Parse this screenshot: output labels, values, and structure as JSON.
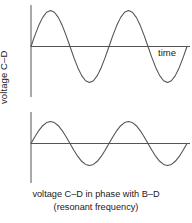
{
  "figure": {
    "caption_line1": "voltage C–D in phase with B–D",
    "caption_line2": "(resonant frequency)",
    "stroke_color": "#555555",
    "text_color": "#1a1a1a",
    "background_color": "#ffffff"
  },
  "chart_data": [
    {
      "type": "line",
      "title": "",
      "name": "voltage-c-d-waveform",
      "ylabel": "voltage C–D",
      "xlabel": "time",
      "waveform": "sine",
      "amplitude": 1.0,
      "cycles": 2,
      "phase_degrees": 0,
      "xlim": [
        0,
        2
      ],
      "ylim": [
        -1.15,
        1.15
      ],
      "grid": false,
      "legend": null,
      "x": [
        0.0,
        0.05,
        0.1,
        0.15,
        0.2,
        0.25,
        0.3,
        0.35,
        0.4,
        0.45,
        0.5,
        0.55,
        0.6,
        0.65,
        0.7,
        0.75,
        0.8,
        0.85,
        0.9,
        0.95,
        1.0,
        1.05,
        1.1,
        1.15,
        1.2,
        1.25,
        1.3,
        1.35,
        1.4,
        1.45,
        1.5,
        1.55,
        1.6,
        1.65,
        1.7,
        1.75,
        1.8,
        1.85,
        1.9,
        1.95,
        2.0
      ],
      "y": [
        0.0,
        0.309,
        0.588,
        0.809,
        0.951,
        1.0,
        0.951,
        0.809,
        0.588,
        0.309,
        0.0,
        -0.309,
        -0.588,
        -0.809,
        -0.951,
        -1.0,
        -0.951,
        -0.809,
        -0.588,
        -0.309,
        0.0,
        0.309,
        0.588,
        0.809,
        0.951,
        1.0,
        0.951,
        0.809,
        0.588,
        0.309,
        0.0,
        -0.309,
        -0.588,
        -0.809,
        -0.951,
        -1.0,
        -0.951,
        -0.809,
        -0.588,
        -0.309,
        0.0
      ]
    },
    {
      "type": "line",
      "title": "",
      "name": "voltage-b-d-waveform",
      "ylabel": "voltage B–D",
      "xlabel": "time",
      "waveform": "sine",
      "amplitude": 1.0,
      "cycles": 2,
      "phase_degrees": 0,
      "xlim": [
        0,
        2
      ],
      "ylim": [
        -1.15,
        1.15
      ],
      "grid": false,
      "legend": null,
      "x": [
        0.0,
        0.05,
        0.1,
        0.15,
        0.2,
        0.25,
        0.3,
        0.35,
        0.4,
        0.45,
        0.5,
        0.55,
        0.6,
        0.65,
        0.7,
        0.75,
        0.8,
        0.85,
        0.9,
        0.95,
        1.0,
        1.05,
        1.1,
        1.15,
        1.2,
        1.25,
        1.3,
        1.35,
        1.4,
        1.45,
        1.5,
        1.55,
        1.6,
        1.65,
        1.7,
        1.75,
        1.8,
        1.85,
        1.9,
        1.95,
        2.0
      ],
      "y": [
        0.0,
        0.309,
        0.588,
        0.809,
        0.951,
        1.0,
        0.951,
        0.809,
        0.588,
        0.309,
        0.0,
        -0.309,
        -0.588,
        -0.809,
        -0.951,
        -1.0,
        -0.951,
        -0.809,
        -0.588,
        -0.309,
        0.0,
        0.309,
        0.588,
        0.809,
        0.951,
        1.0,
        0.951,
        0.809,
        0.588,
        0.309,
        0.0,
        -0.309,
        -0.588,
        -0.809,
        -0.951,
        -1.0,
        -0.951,
        -0.809,
        -0.588,
        -0.309,
        0.0
      ]
    }
  ]
}
